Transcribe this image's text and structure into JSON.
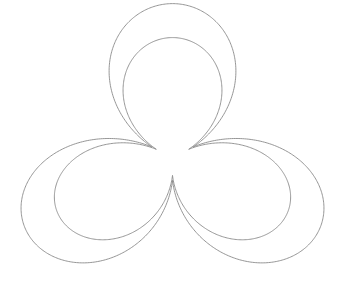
{
  "figure": {
    "width": 345,
    "height": 292,
    "background": "#ffffff",
    "stroke_color": "#8a8a8a",
    "stroke_width": 0.9,
    "shape": "trefoil-band",
    "center": [
      172.5,
      158
    ],
    "curves": [
      {
        "name": "outer-strand",
        "scale": 1.0
      },
      {
        "name": "inner-strand",
        "scale": 0.78
      }
    ],
    "lobes": 3,
    "radius": 142,
    "base_radius": 24,
    "rotation_deg": -90,
    "vertical_squash": 0.93
  }
}
